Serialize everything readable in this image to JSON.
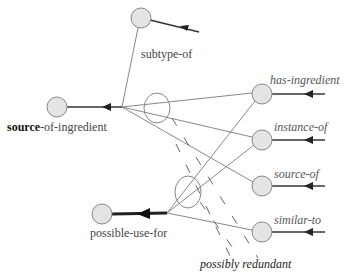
{
  "diagram": {
    "type": "semantic-network",
    "nodes": [
      {
        "id": "subtype-node",
        "label": "subtype-of",
        "cx": 141,
        "cy": 18
      },
      {
        "id": "source-of-ingredient-node",
        "label_bold": "source",
        "label_rest": "-of-ingredient",
        "cx": 57,
        "cy": 107
      },
      {
        "id": "possible-use-for-node",
        "label": "possible-use-for",
        "cx": 102,
        "cy": 214
      },
      {
        "id": "has-ingredient-node",
        "label": "has-ingredient",
        "cx": 262,
        "cy": 94
      },
      {
        "id": "instance-of-node",
        "label": "instance-of",
        "cx": 262,
        "cy": 140
      },
      {
        "id": "source-of-node",
        "label": "source-of",
        "cx": 262,
        "cy": 186
      },
      {
        "id": "similar-to-node",
        "label": "similar-to",
        "cx": 262,
        "cy": 232
      }
    ],
    "labels": {
      "subtype_of": "subtype-of",
      "source_bold": "source",
      "source_rest": "-of-ingredient",
      "possible_use_for": "possible-use-for",
      "has_ingredient": "has-ingredient",
      "instance_of": "instance-of",
      "source_of": "source-of",
      "similar_to": "similar-to",
      "possibly_redundant": "possibly redundant"
    },
    "colors": {
      "node_fill": "#e4e4e4",
      "node_stroke": "#888888",
      "line": "#777777",
      "arrow": "#222222"
    }
  }
}
